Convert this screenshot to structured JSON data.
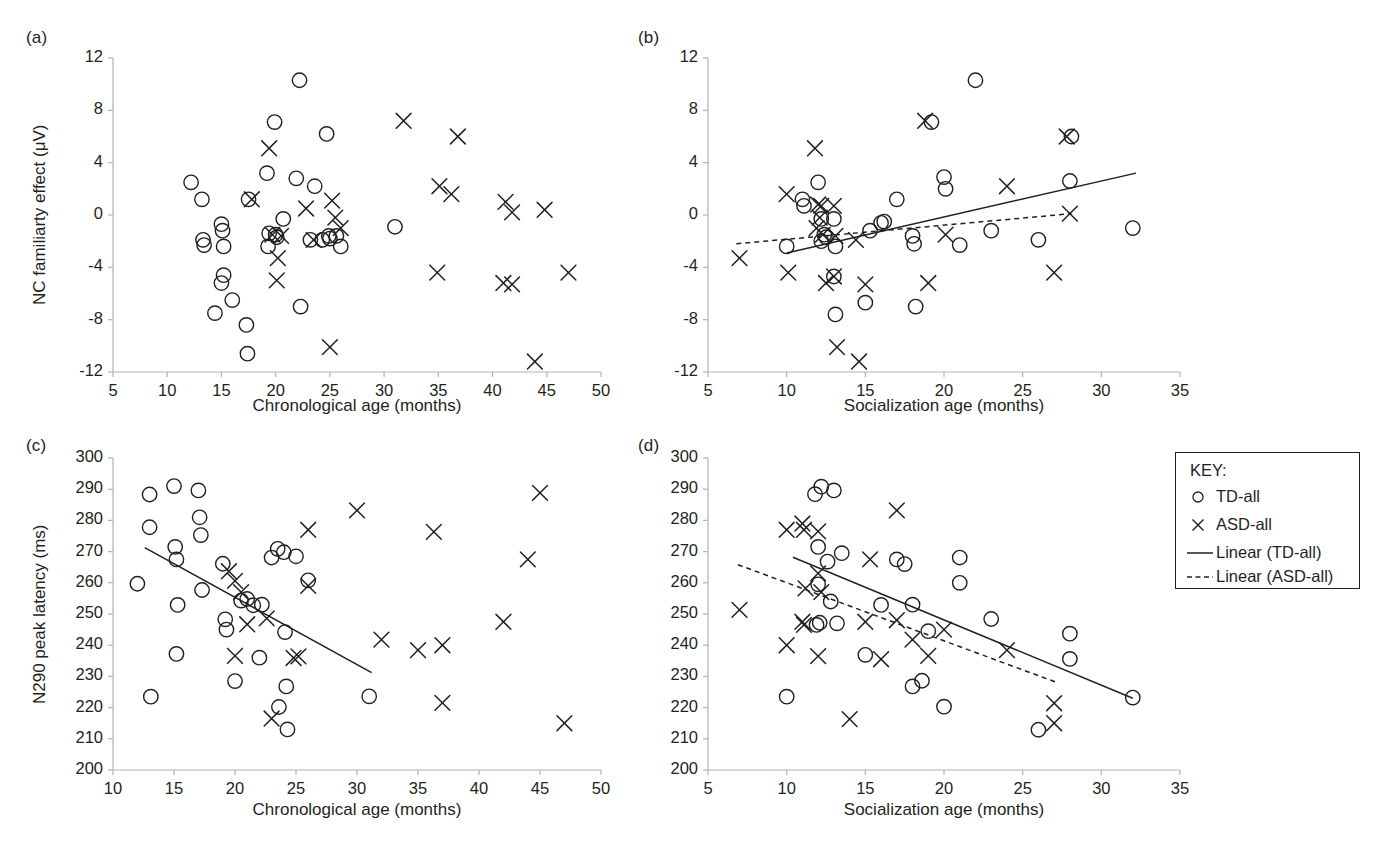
{
  "figure": {
    "background": "#ffffff",
    "ink": "#231f20",
    "axis_color": "#b3b3b3"
  },
  "legend": {
    "title": "KEY:",
    "items": [
      {
        "symbol": "circle",
        "label": "TD-all"
      },
      {
        "symbol": "cross",
        "label": "ASD-all"
      },
      {
        "symbol": "solid-line",
        "label": "Linear (TD-all)"
      },
      {
        "symbol": "dashed-line",
        "label": "Linear (ASD-all)"
      }
    ]
  },
  "chart_data": [
    {
      "id": "panel-a",
      "tag": "(a)",
      "type": "scatter",
      "title": "",
      "xlabel": "Chronological age (months)",
      "ylabel": "NC familiarty effect (μV)",
      "xlim": [
        5,
        50
      ],
      "ylim": [
        -12,
        12
      ],
      "xticks": [
        5,
        10,
        15,
        20,
        25,
        30,
        35,
        40,
        45,
        50
      ],
      "yticks": [
        -12,
        -8,
        -4,
        0,
        4,
        8,
        12
      ],
      "grid": false,
      "legend_position": "none",
      "series": [
        {
          "name": "TD-all",
          "marker": "circle",
          "points": [
            [
              12.2,
              2.5
            ],
            [
              13.2,
              1.2
            ],
            [
              13.3,
              -1.9
            ],
            [
              13.4,
              -2.3
            ],
            [
              15.0,
              -0.7
            ],
            [
              15.1,
              -1.2
            ],
            [
              15.2,
              -2.4
            ],
            [
              15.2,
              -4.6
            ],
            [
              15.0,
              -5.2
            ],
            [
              14.4,
              -7.5
            ],
            [
              16.0,
              -6.5
            ],
            [
              17.3,
              -8.4
            ],
            [
              17.4,
              -10.6
            ],
            [
              17.5,
              1.2
            ],
            [
              19.2,
              3.2
            ],
            [
              19.3,
              -2.4
            ],
            [
              19.9,
              7.1
            ],
            [
              20.0,
              -1.5
            ],
            [
              20.7,
              -0.3
            ],
            [
              21.9,
              2.8
            ],
            [
              22.2,
              10.3
            ],
            [
              22.3,
              -7.0
            ],
            [
              23.2,
              -1.9
            ],
            [
              23.6,
              2.2
            ],
            [
              24.3,
              -1.9
            ],
            [
              24.7,
              6.2
            ],
            [
              25.0,
              -1.8
            ],
            [
              25.6,
              -1.6
            ],
            [
              26.0,
              -2.4
            ],
            [
              31.0,
              -0.9
            ],
            [
              19.4,
              -1.4
            ],
            [
              20.1,
              -1.7
            ],
            [
              24.9,
              -1.6
            ]
          ]
        },
        {
          "name": "ASD-all",
          "marker": "cross",
          "points": [
            [
              17.8,
              1.2
            ],
            [
              19.4,
              5.1
            ],
            [
              19.7,
              -1.5
            ],
            [
              20.2,
              -3.3
            ],
            [
              20.1,
              -5.0
            ],
            [
              20.5,
              -1.6
            ],
            [
              22.8,
              0.5
            ],
            [
              23.5,
              -1.9
            ],
            [
              25.2,
              1.1
            ],
            [
              25.5,
              -0.2
            ],
            [
              26.0,
              -1.0
            ],
            [
              25.0,
              -10.1
            ],
            [
              31.8,
              7.2
            ],
            [
              35.1,
              2.2
            ],
            [
              36.2,
              1.6
            ],
            [
              36.8,
              6.0
            ],
            [
              34.9,
              -4.4
            ],
            [
              41.2,
              1.0
            ],
            [
              41.8,
              0.2
            ],
            [
              44.8,
              0.4
            ],
            [
              41.0,
              -5.2
            ],
            [
              41.8,
              -5.3
            ],
            [
              43.9,
              -11.2
            ],
            [
              47.0,
              -4.4
            ]
          ]
        }
      ],
      "trendlines": []
    },
    {
      "id": "panel-b",
      "tag": "(b)",
      "type": "scatter",
      "title": "",
      "xlabel": "Socialization age (months)",
      "ylabel": "",
      "xlim": [
        5,
        35
      ],
      "ylim": [
        -12,
        12
      ],
      "xticks": [
        5,
        10,
        15,
        20,
        25,
        30,
        35
      ],
      "yticks": [
        -12,
        -8,
        -4,
        0,
        4,
        8,
        12
      ],
      "grid": false,
      "legend_position": "none",
      "series": [
        {
          "name": "TD-all",
          "marker": "circle",
          "points": [
            [
              10.0,
              -2.4
            ],
            [
              11.0,
              1.2
            ],
            [
              11.1,
              0.7
            ],
            [
              12.0,
              2.5
            ],
            [
              12.2,
              -0.3
            ],
            [
              12.4,
              -1.5
            ],
            [
              12.5,
              -1.7
            ],
            [
              13.0,
              -0.3
            ],
            [
              13.1,
              -2.4
            ],
            [
              13.0,
              -4.7
            ],
            [
              13.1,
              -7.6
            ],
            [
              15.0,
              -6.7
            ],
            [
              15.3,
              -1.2
            ],
            [
              16.0,
              -0.6
            ],
            [
              16.2,
              -0.5
            ],
            [
              17.0,
              1.2
            ],
            [
              18.0,
              -1.6
            ],
            [
              18.1,
              -2.2
            ],
            [
              18.2,
              -7.0
            ],
            [
              20.0,
              2.9
            ],
            [
              20.1,
              2.0
            ],
            [
              21.0,
              -2.3
            ],
            [
              22.0,
              10.3
            ],
            [
              23.0,
              -1.2
            ],
            [
              26.0,
              -1.9
            ],
            [
              28.0,
              2.6
            ],
            [
              28.1,
              6.0
            ],
            [
              19.2,
              7.1
            ],
            [
              32.0,
              -1.0
            ],
            [
              12.2,
              -2.0
            ]
          ]
        },
        {
          "name": "ASD-all",
          "marker": "cross",
          "points": [
            [
              7.0,
              -3.3
            ],
            [
              10.0,
              1.6
            ],
            [
              10.1,
              -4.4
            ],
            [
              11.8,
              5.1
            ],
            [
              12.0,
              0.8
            ],
            [
              12.2,
              0.7
            ],
            [
              12.1,
              -0.2
            ],
            [
              12.3,
              -1.5
            ],
            [
              11.9,
              -1.0
            ],
            [
              12.5,
              -5.2
            ],
            [
              13.0,
              0.7
            ],
            [
              13.1,
              -1.6
            ],
            [
              13.0,
              -4.7
            ],
            [
              13.2,
              -10.1
            ],
            [
              14.6,
              -11.2
            ],
            [
              14.4,
              -1.9
            ],
            [
              15.0,
              -5.3
            ],
            [
              18.8,
              7.2
            ],
            [
              19.0,
              -5.2
            ],
            [
              20.1,
              -1.5
            ],
            [
              24.0,
              2.2
            ],
            [
              27.0,
              -4.4
            ],
            [
              28.0,
              0.1
            ],
            [
              27.8,
              6.0
            ]
          ]
        }
      ],
      "trendlines": [
        {
          "name": "Linear (TD-all)",
          "style": "solid",
          "x1": 10.0,
          "y1": -2.9,
          "x2": 32.2,
          "y2": 3.2
        },
        {
          "name": "Linear (ASD-all)",
          "style": "dashed",
          "x1": 6.8,
          "y1": -2.2,
          "x2": 28.1,
          "y2": 0.1
        }
      ]
    },
    {
      "id": "panel-c",
      "tag": "(c)",
      "type": "scatter",
      "title": "",
      "xlabel": "Chronological age (months)",
      "ylabel": "N290 peak latency (ms)",
      "xlim": [
        10,
        50
      ],
      "ylim": [
        200,
        300
      ],
      "xticks": [
        10,
        15,
        20,
        25,
        30,
        35,
        40,
        45,
        50
      ],
      "yticks": [
        200,
        210,
        220,
        230,
        240,
        250,
        260,
        270,
        280,
        290,
        300
      ],
      "grid": false,
      "legend_position": "none",
      "series": [
        {
          "name": "TD-all",
          "marker": "circle",
          "points": [
            [
              12.0,
              259.7
            ],
            [
              13.0,
              288.3
            ],
            [
              13.0,
              277.8
            ],
            [
              13.1,
              223.5
            ],
            [
              15.0,
              291.0
            ],
            [
              15.1,
              271.5
            ],
            [
              15.2,
              267.5
            ],
            [
              15.3,
              252.9
            ],
            [
              15.2,
              237.2
            ],
            [
              17.0,
              289.6
            ],
            [
              17.1,
              281.0
            ],
            [
              17.2,
              275.3
            ],
            [
              17.3,
              257.7
            ],
            [
              19.0,
              266.1
            ],
            [
              19.2,
              248.3
            ],
            [
              19.3,
              245.0
            ],
            [
              20.0,
              228.5
            ],
            [
              20.5,
              254.3
            ],
            [
              21.0,
              254.8
            ],
            [
              21.5,
              252.8
            ],
            [
              22.0,
              236.0
            ],
            [
              22.2,
              253.0
            ],
            [
              23.0,
              268.1
            ],
            [
              23.5,
              270.9
            ],
            [
              23.6,
              220.2
            ],
            [
              24.0,
              269.8
            ],
            [
              24.1,
              244.2
            ],
            [
              24.2,
              226.8
            ],
            [
              24.3,
              213.0
            ],
            [
              25.0,
              268.5
            ],
            [
              26.0,
              260.8
            ],
            [
              31.0,
              223.6
            ]
          ]
        },
        {
          "name": "ASD-all",
          "marker": "cross",
          "points": [
            [
              19.5,
              263.7
            ],
            [
              20.0,
              260.6
            ],
            [
              20.0,
              236.6
            ],
            [
              20.5,
              257.0
            ],
            [
              21.0,
              246.7
            ],
            [
              22.6,
              248.6
            ],
            [
              23.0,
              216.5
            ],
            [
              24.8,
              235.9
            ],
            [
              25.2,
              236.4
            ],
            [
              26.0,
              259.0
            ],
            [
              26.0,
              277.0
            ],
            [
              30.0,
              283.2
            ],
            [
              32.0,
              241.8
            ],
            [
              35.0,
              238.4
            ],
            [
              36.3,
              276.3
            ],
            [
              37.0,
              240.0
            ],
            [
              37.0,
              221.5
            ],
            [
              42.0,
              247.5
            ],
            [
              44.0,
              267.5
            ],
            [
              45.0,
              288.8
            ],
            [
              47.0,
              215.0
            ]
          ]
        }
      ],
      "trendlines": [
        {
          "name": "Linear (TD-all)",
          "style": "solid",
          "x1": 12.6,
          "y1": 271.3,
          "x2": 31.2,
          "y2": 231.2
        }
      ]
    },
    {
      "id": "panel-d",
      "tag": "(d)",
      "type": "scatter",
      "title": "",
      "xlabel": "Socialization age (months)",
      "ylabel": "",
      "xlim": [
        5,
        35
      ],
      "ylim": [
        200,
        300
      ],
      "xticks": [
        5,
        10,
        15,
        20,
        25,
        30,
        35
      ],
      "yticks": [
        200,
        210,
        220,
        230,
        240,
        250,
        260,
        270,
        280,
        290,
        300
      ],
      "grid": false,
      "legend_position": "outside-right",
      "series": [
        {
          "name": "TD-all",
          "marker": "circle",
          "points": [
            [
              10.0,
              223.5
            ],
            [
              11.8,
              288.4
            ],
            [
              12.0,
              271.5
            ],
            [
              12.0,
              259.5
            ],
            [
              12.2,
              290.8
            ],
            [
              12.6,
              266.8
            ],
            [
              12.8,
              254.0
            ],
            [
              13.0,
              289.6
            ],
            [
              13.2,
              247.0
            ],
            [
              13.5,
              269.5
            ],
            [
              15.0,
              236.9
            ],
            [
              16.0,
              252.9
            ],
            [
              17.0,
              267.5
            ],
            [
              17.5,
              266.0
            ],
            [
              18.0,
              253.0
            ],
            [
              18.0,
              226.8
            ],
            [
              18.6,
              228.6
            ],
            [
              19.0,
              244.5
            ],
            [
              20.0,
              220.3
            ],
            [
              21.0,
              268.1
            ],
            [
              21.0,
              260.0
            ],
            [
              23.0,
              248.4
            ],
            [
              26.0,
              212.9
            ],
            [
              28.0,
              243.7
            ],
            [
              28.0,
              235.6
            ],
            [
              32.0,
              223.2
            ],
            [
              12.1,
              247.2
            ],
            [
              11.9,
              246.5
            ]
          ]
        },
        {
          "name": "ASD-all",
          "marker": "cross",
          "points": [
            [
              7.0,
              251.3
            ],
            [
              10.0,
              277.0
            ],
            [
              10.0,
              240.0
            ],
            [
              11.0,
              279.0
            ],
            [
              11.1,
              277.0
            ],
            [
              11.2,
              258.2
            ],
            [
              11.0,
              247.5
            ],
            [
              11.1,
              246.5
            ],
            [
              12.0,
              276.5
            ],
            [
              12.0,
              263.0
            ],
            [
              12.2,
              257.0
            ],
            [
              12.0,
              236.5
            ],
            [
              14.0,
              216.3
            ],
            [
              15.0,
              247.5
            ],
            [
              16.0,
              235.5
            ],
            [
              17.0,
              283.2
            ],
            [
              17.0,
              248.0
            ],
            [
              15.3,
              267.5
            ],
            [
              18.0,
              241.8
            ],
            [
              19.0,
              236.6
            ],
            [
              20.0,
              245.0
            ],
            [
              24.0,
              238.4
            ],
            [
              27.0,
              221.4
            ],
            [
              27.0,
              215.0
            ]
          ]
        }
      ],
      "trendlines": [
        {
          "name": "Linear (TD-all)",
          "style": "solid",
          "x1": 10.4,
          "y1": 268.2,
          "x2": 32.0,
          "y2": 223.0
        },
        {
          "name": "Linear (ASD-all)",
          "style": "dashed",
          "x1": 6.9,
          "y1": 265.8,
          "x2": 27.2,
          "y2": 228.0
        }
      ]
    }
  ]
}
